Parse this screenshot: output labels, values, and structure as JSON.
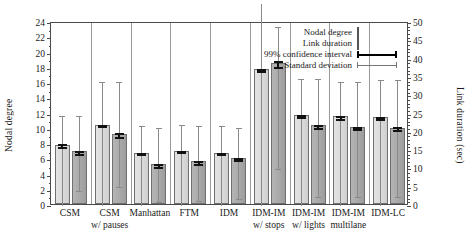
{
  "chart_data": {
    "type": "bar",
    "title": "",
    "xlabel": "",
    "ylabel": "Nodal degree",
    "ylabel_right": "Link duration (sec)",
    "ylim": [
      0,
      24
    ],
    "ylim_right": [
      0,
      50
    ],
    "yticks": [
      0,
      2,
      4,
      6,
      8,
      10,
      12,
      14,
      16,
      18,
      20,
      22,
      24
    ],
    "yticks_right": [
      0,
      5,
      10,
      15,
      20,
      25,
      30,
      35,
      40,
      45,
      50
    ],
    "grid": false,
    "legend_position": "top-right",
    "categories": [
      "CSM",
      "CSM w/ pauses",
      "Manhattan",
      "FTM",
      "IDM",
      "IDM-IM w/ stops",
      "IDM-IM w/ lights",
      "IDM-IM multilane",
      "IDM-LC"
    ],
    "category_lines": [
      [
        "CSM",
        ""
      ],
      [
        "CSM",
        "w/ pauses"
      ],
      [
        "Manhattan",
        ""
      ],
      [
        "FTM",
        ""
      ],
      [
        "IDM",
        ""
      ],
      [
        "IDM-IM",
        "w/ stops"
      ],
      [
        "IDM-IM",
        "w/ lights"
      ],
      [
        "IDM-IM",
        "multilane"
      ],
      [
        "IDM-LC",
        ""
      ]
    ],
    "series": [
      {
        "name": "Nodal degree",
        "axis": "left",
        "color": "#dcdcdc",
        "values": [
          7.8,
          10.4,
          6.7,
          7.0,
          6.7,
          17.7,
          11.7,
          11.5,
          11.4
        ],
        "ci_low": [
          7.5,
          10.2,
          6.5,
          6.8,
          6.5,
          17.4,
          11.4,
          11.2,
          11.1
        ],
        "ci_high": [
          8.1,
          10.6,
          6.9,
          7.2,
          6.9,
          18.0,
          12.0,
          11.8,
          11.7
        ],
        "sd_low": [
          0.0,
          0.0,
          0.0,
          0.0,
          0.0,
          0.0,
          0.0,
          0.0,
          0.0
        ],
        "sd_high": [
          11.8,
          16.3,
          10.5,
          10.6,
          10.5,
          26.5,
          16.6,
          16.3,
          16.5
        ]
      },
      {
        "name": "Link duration",
        "axis": "right",
        "color": "#a8a8a8",
        "values": [
          14.3,
          19.2,
          10.8,
          11.6,
          12.5,
          38.5,
          21.5,
          21.1,
          20.9
        ],
        "values_left_scale": [
          6.9,
          9.2,
          5.2,
          5.6,
          6.0,
          18.5,
          10.3,
          10.1,
          10.0
        ],
        "ci_low": [
          13.7,
          18.4,
          10.2,
          11.0,
          11.9,
          37.5,
          20.9,
          20.5,
          20.3
        ],
        "ci_high": [
          14.9,
          20.0,
          11.4,
          12.2,
          13.1,
          39.5,
          22.1,
          21.7,
          21.5
        ],
        "sd_low": [
          3.7,
          4.8,
          0.8,
          1.2,
          1.6,
          9.8,
          2.3,
          2.2,
          2.1
        ],
        "sd_high": [
          24.6,
          33.9,
          21.3,
          21.8,
          21.3,
          49.0,
          34.6,
          33.9,
          34.4
        ]
      }
    ]
  },
  "legend": {
    "items": [
      {
        "label": "Nodal degree",
        "key": "swatch-light"
      },
      {
        "label": "Link duration",
        "key": "swatch-dark"
      },
      {
        "label": "99% confidence interval",
        "key": "line-thick"
      },
      {
        "label": "Standard deviation",
        "key": "line-thin"
      }
    ]
  }
}
